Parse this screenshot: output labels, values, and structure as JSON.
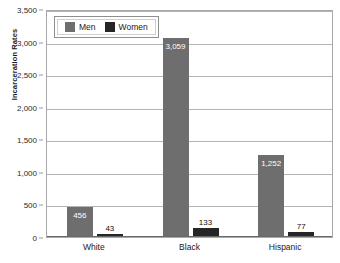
{
  "chart_data": {
    "type": "bar",
    "title": "",
    "subtitle": "",
    "xlabel": "",
    "ylabel": "Incarceration Rates",
    "categories": [
      "White",
      "Black",
      "Hispanic"
    ],
    "series": [
      {
        "name": "Men",
        "color": "#6e6e6e",
        "values": [
          456,
          3059,
          1252
        ],
        "value_labels": [
          "456",
          "3,059",
          "1,252"
        ]
      },
      {
        "name": "Women",
        "color": "#262626",
        "values": [
          43,
          133,
          77
        ],
        "value_labels": [
          "43",
          "133",
          "77"
        ]
      }
    ],
    "ylim": [
      0,
      3500
    ],
    "ytick_values": [
      0,
      500,
      1000,
      1500,
      2000,
      2500,
      3000,
      3500
    ],
    "ytick_labels": [
      "0",
      "500",
      "1,000",
      "1,500",
      "2,000",
      "2,500",
      "3,000",
      "3,500"
    ],
    "grid": true,
    "legend_position": "top-left-inside",
    "legend_entries": [
      "Men",
      "Women"
    ]
  },
  "legend": {
    "men_label": "Men",
    "women_label": "Women"
  },
  "axes": {
    "y_title": "Incarceration Rates"
  },
  "colors": {
    "men": "#6e6e6e",
    "women": "#262626",
    "gridline": "#b4b4b4",
    "frame": "#a8a8a8",
    "background": "#ffffff"
  }
}
